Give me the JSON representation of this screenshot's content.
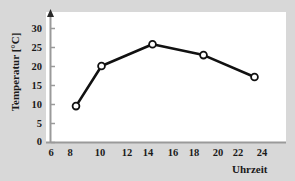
{
  "chart_data": {
    "type": "line",
    "title": "",
    "subtitle": "",
    "xlabel": "Uhrzeit",
    "ylabel": "Temperatur [°C]",
    "x": [
      8,
      10,
      14,
      18,
      22
    ],
    "values": [
      10,
      21,
      27,
      24,
      18
    ],
    "series": [
      {
        "name": "Temperatur",
        "x": [
          8,
          10,
          14,
          18,
          22
        ],
        "values": [
          10,
          21,
          27,
          24,
          18
        ]
      }
    ],
    "xlim": [
      6,
      24
    ],
    "ylim": [
      0,
      32
    ],
    "xticks": [
      6,
      8,
      10,
      12,
      14,
      16,
      18,
      20,
      22,
      24
    ],
    "yticks": [
      0,
      5,
      10,
      15,
      20,
      25,
      30
    ],
    "xtick_labels": [
      "6",
      "8",
      "10",
      "12",
      "14",
      "16",
      "18",
      "20",
      "22",
      "24"
    ],
    "ytick_labels": [
      "0",
      "5",
      "10",
      "15",
      "20",
      "25",
      "30"
    ],
    "grid": false,
    "legend": false,
    "legend_position": "none",
    "marker": "open-circle",
    "line_color": "#111111",
    "marker_face_color": "#ffffff",
    "marker_edge_color": "#111111",
    "axis_color": "#9a9a9a",
    "text_color": "#1a1a1a",
    "plot_background": "#ffffff",
    "figure_background": "#d8d8d8",
    "y_axis_arrow": true,
    "annotations": []
  },
  "axes": {
    "y_label": "Temperatur [°C]",
    "x_label": "Uhrzeit"
  },
  "ticks": {
    "y": [
      {
        "label": "30",
        "value": 30
      },
      {
        "label": "25",
        "value": 25
      },
      {
        "label": "20",
        "value": 20
      },
      {
        "label": "15",
        "value": 15
      },
      {
        "label": "10",
        "value": 10
      },
      {
        "label": "5",
        "value": 5
      },
      {
        "label": "0",
        "value": 0
      }
    ],
    "x": [
      {
        "label": "6",
        "value": 6
      },
      {
        "label": "8",
        "value": 8
      },
      {
        "label": "10",
        "value": 10
      },
      {
        "label": "12",
        "value": 12
      },
      {
        "label": "14",
        "value": 14
      },
      {
        "label": "16",
        "value": 16
      },
      {
        "label": "18",
        "value": 18
      },
      {
        "label": "20",
        "value": 20
      },
      {
        "label": "22",
        "value": 22
      },
      {
        "label": "24",
        "value": 24
      }
    ]
  }
}
